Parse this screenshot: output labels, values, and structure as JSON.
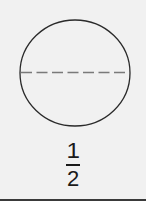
{
  "diagram": {
    "shape": "circle",
    "divisions": 2,
    "divider_style": "dashed-horizontal",
    "colors": {
      "background": "#f1f1f1",
      "outline": "#2a2a2a",
      "divider": "#7a7a7a",
      "text": "#1a1a1a"
    }
  },
  "fraction": {
    "numerator": "1",
    "denominator": "2"
  }
}
